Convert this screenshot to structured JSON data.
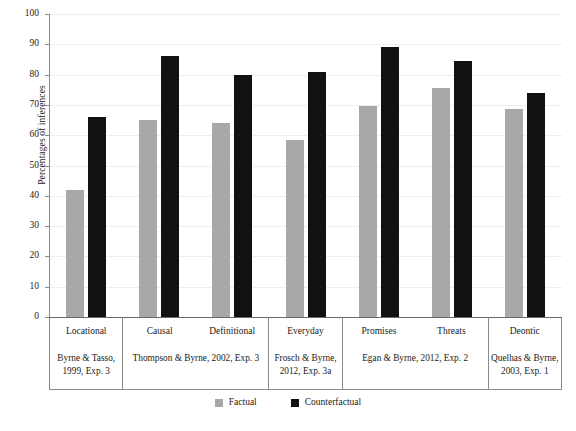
{
  "chart_data": {
    "type": "bar",
    "title": "",
    "subtitle": "",
    "xlabel": "",
    "ylabel": "Percentages of inferences",
    "ylim": [
      0,
      100
    ],
    "ytick_step": 10,
    "yticks": [
      100,
      90,
      80,
      70,
      60,
      50,
      40,
      30,
      20,
      10,
      0
    ],
    "grid": true,
    "legend_position": "bottom-center",
    "categories": [
      "Locational",
      "Causal",
      "Definitional",
      "Everyday",
      "Promises",
      "Threats",
      "Deontic"
    ],
    "series": [
      {
        "name": "Factual",
        "color": "#a8a8a8",
        "values": [
          42,
          65,
          64,
          58.5,
          69.5,
          75.5,
          68.5
        ]
      },
      {
        "name": "Counterfactual",
        "color": "#111111",
        "values": [
          66,
          86,
          80,
          81,
          89,
          84.5,
          74
        ]
      }
    ],
    "category_groups": [
      {
        "categories": [
          "Locational"
        ],
        "citation": "Byrne & Tasso, 1999, Exp. 3"
      },
      {
        "categories": [
          "Causal",
          "Definitional"
        ],
        "citation": "Thompson & Byrne, 2002, Exp. 3"
      },
      {
        "categories": [
          "Everyday"
        ],
        "citation": "Frosch & Byrne, 2012, Exp. 3a"
      },
      {
        "categories": [
          "Promises",
          "Threats"
        ],
        "citation": "Egan & Byrne, 2012, Exp. 2"
      },
      {
        "categories": [
          "Deontic"
        ],
        "citation": "Quelhas & Byrne, 2003, Exp. 1"
      }
    ]
  },
  "legend": {
    "entries": [
      {
        "label": "Factual",
        "color": "#a8a8a8"
      },
      {
        "label": "Counterfactual",
        "color": "#111111"
      }
    ]
  }
}
